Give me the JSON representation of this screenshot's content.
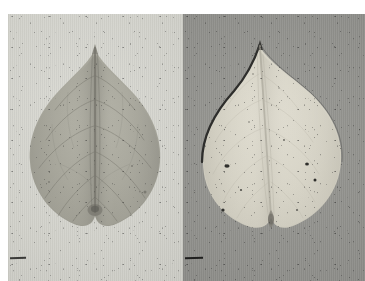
{
  "figure": {
    "domain_kind": "scanned-photographic-plate",
    "header_caption": "",
    "panel_count": 2,
    "panels": [
      {
        "id": "panel-left",
        "position": "left",
        "subject": "cordate leaf, adaxial surface",
        "leaf_shape": "heart-shaped (cordate) with acuminate apex",
        "leaf_tone": "mid grey-green",
        "background_tone": "light grey paper",
        "background_hex": "#d4d4ce",
        "leaf_hex": "#a8a79c",
        "venation": "palmate, prominent midrib with arching lateral veins",
        "margin_marks": "1 short pencil tick on left margin"
      },
      {
        "id": "panel-right",
        "position": "right",
        "subject": "cordate leaf, abaxial surface",
        "leaf_shape": "heart-shaped (cordate) with acuminate apex",
        "leaf_tone": "pale cream / near-white",
        "background_tone": "dark grey mottled ground",
        "background_hex": "#939390",
        "leaf_hex": "#d8d5c8",
        "venation": "faint, midrib visible, lateral veins subtle",
        "margin_marks": "1 short pencil tick on left margin"
      }
    ],
    "plate_geometry": {
      "left_px": 8,
      "top_px": 14,
      "width_px": 357,
      "height_px": 267,
      "divider_x_px": 183
    },
    "colors": {
      "page_background": "#ffffff",
      "left_panel_background": "#d4d4ce",
      "right_panel_background": "#939390",
      "left_leaf": "#a8a79c",
      "right_leaf": "#d8d5c8",
      "caption_text": "#f2f2f4"
    }
  }
}
